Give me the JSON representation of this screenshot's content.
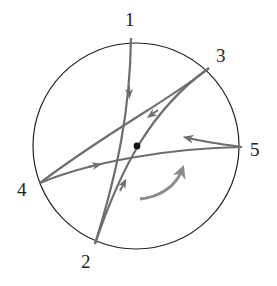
{
  "diagram": {
    "colors": {
      "circle": "#222222",
      "paths": "#6e6e6e",
      "rotation_arrow": "#8c8c8c",
      "center_dot": "#111111"
    },
    "points": [
      {
        "id": "1",
        "label": "1"
      },
      {
        "id": "2",
        "label": "2"
      },
      {
        "id": "3",
        "label": "3"
      },
      {
        "id": "4",
        "label": "4"
      },
      {
        "id": "5",
        "label": "5"
      }
    ],
    "paths": [
      {
        "from": "1",
        "to": "2",
        "direction": "downward from 1"
      },
      {
        "from": "3",
        "to": "4",
        "direction": "from 3 toward 4"
      },
      {
        "from": "4",
        "to": "5",
        "direction": "from 4 toward 5"
      },
      {
        "from": "2",
        "to": "3",
        "direction": "from 2 toward 3"
      },
      {
        "from": "5",
        "to": "interior",
        "direction": "from 5 inward (leftward arrow)"
      }
    ],
    "rotation_arrow": {
      "direction": "counterclockwise"
    },
    "center_dot": true
  }
}
